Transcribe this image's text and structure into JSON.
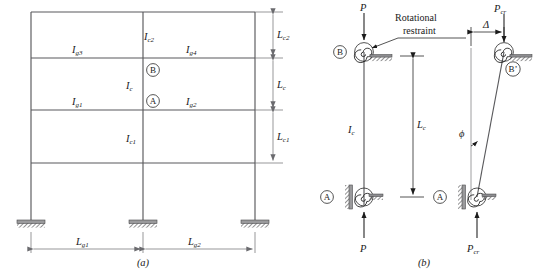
{
  "figure": {
    "panel_a": {
      "caption": "(a)",
      "member_labels": [
        {
          "id": "Ic2",
          "base": "I",
          "sub": "c2",
          "name": "column-inertia-upper"
        },
        {
          "id": "Ig3",
          "base": "I",
          "sub": "g3",
          "name": "girder-inertia-g3"
        },
        {
          "id": "Ig4",
          "base": "I",
          "sub": "g4",
          "name": "girder-inertia-g4"
        },
        {
          "id": "Ic",
          "base": "I",
          "sub": "c",
          "name": "column-inertia-middle"
        },
        {
          "id": "Ig1",
          "base": "I",
          "sub": "g1",
          "name": "girder-inertia-g1"
        },
        {
          "id": "Ig2",
          "base": "I",
          "sub": "g2",
          "name": "girder-inertia-g2"
        },
        {
          "id": "Ic1",
          "base": "I",
          "sub": "c1",
          "name": "column-inertia-lower"
        }
      ],
      "joint_markers": [
        {
          "id": "B",
          "name": "joint-marker-b"
        },
        {
          "id": "A",
          "name": "joint-marker-a"
        }
      ],
      "vertical_dimensions": [
        {
          "id": "Lc2",
          "base": "L",
          "sub": "c2",
          "name": "dimension-lc2"
        },
        {
          "id": "Lc",
          "base": "L",
          "sub": "c",
          "name": "dimension-lc"
        },
        {
          "id": "Lc1",
          "base": "L",
          "sub": "c1",
          "name": "dimension-lc1"
        }
      ],
      "horizontal_dimensions": [
        {
          "id": "Lg1",
          "base": "L",
          "sub": "g1",
          "name": "dimension-lg1"
        },
        {
          "id": "Lg2",
          "base": "L",
          "sub": "g2",
          "name": "dimension-lg2"
        }
      ]
    },
    "panel_b": {
      "caption": "(b)",
      "undeformed": {
        "load_top": {
          "base": "P",
          "sub": "",
          "name": "load-p-top"
        },
        "load_bottom": {
          "base": "P",
          "sub": "",
          "name": "load-p-bottom"
        },
        "column_label": {
          "base": "I",
          "sub": "c",
          "name": "column-inertia-label"
        },
        "length_label": {
          "base": "L",
          "sub": "c",
          "name": "column-length-lc"
        },
        "joint_b": {
          "id": "B",
          "name": "joint-marker-b"
        },
        "joint_a": {
          "id": "A",
          "name": "joint-marker-a"
        },
        "annotation": {
          "line1": "Rotational",
          "line2": "restraint",
          "name": "rotational-restraint-annotation"
        }
      },
      "buckled": {
        "load_top": {
          "base": "P",
          "sub": "cr",
          "name": "load-pcr-top"
        },
        "load_bottom": {
          "base": "P",
          "sub": "cr",
          "name": "load-pcr-bottom"
        },
        "sway_label": {
          "base": "Δ",
          "sub": "",
          "name": "sway-displacement-delta"
        },
        "angle_label": {
          "base": "ϕ",
          "sub": "",
          "name": "rotation-angle-phi"
        },
        "joint_b_prime": {
          "id": "B’",
          "name": "joint-marker-b-prime"
        },
        "joint_a": {
          "id": "A",
          "name": "joint-marker-a"
        }
      }
    }
  },
  "colors": {
    "member_gray": "#59595c",
    "dimension_gray": "#6a6a6e",
    "ink_black": "#1b1b1b",
    "plate_gray": "#9a9a9c",
    "background": "#ffffff"
  }
}
